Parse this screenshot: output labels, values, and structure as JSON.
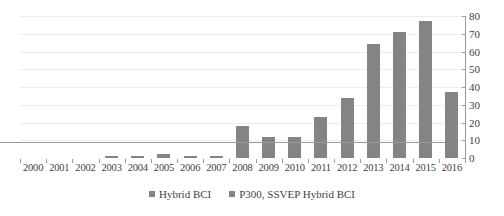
{
  "chart_data": {
    "type": "bar",
    "title": "",
    "subtitle": "",
    "xlabel": "",
    "ylabel": "",
    "categories": [
      "2000",
      "2001",
      "2002",
      "2003",
      "2004",
      "2005",
      "2006",
      "2007",
      "2008",
      "2009",
      "2010",
      "2011",
      "2012",
      "2013",
      "2014",
      "2015",
      "2016"
    ],
    "series": [
      {
        "name": "Hybrid BCI",
        "color": "#848484",
        "values": [
          0,
          0,
          0,
          1,
          1,
          2,
          1,
          1,
          18,
          12,
          12,
          23,
          34,
          64,
          71,
          77,
          37
        ]
      },
      {
        "name": "P300, SSVEP Hybrid BCI",
        "color": "#848484",
        "values": [
          0,
          0,
          0,
          0,
          0,
          0,
          0,
          0,
          0,
          0,
          0,
          0,
          0,
          0,
          0,
          0,
          0
        ]
      }
    ],
    "ylim": [
      0,
      80
    ],
    "ytick_values": [
      0,
      10,
      20,
      30,
      40,
      50,
      60,
      70,
      80
    ],
    "ytick_labels": [
      "0",
      "10",
      "20",
      "30",
      "40",
      "50",
      "60",
      "70",
      "80"
    ],
    "y_axis_position": "right",
    "grid": true,
    "grid_axis": "y",
    "grid_color": "#ececed",
    "axis_color": "#9a9a9a",
    "legend_position": "bottom",
    "plot_background": "#ffffff"
  },
  "legend": {
    "items": [
      {
        "label": "Hybrid BCI",
        "color": "#848484"
      },
      {
        "label": "P300, SSVEP Hybrid BCI",
        "color": "#848484"
      }
    ]
  }
}
